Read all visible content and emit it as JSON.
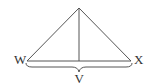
{
  "diagram": {
    "type": "geometry",
    "stroke_color": "#555555",
    "label_color": "#333333",
    "vertices": {
      "apex": {
        "label": "",
        "x": 79,
        "y": 8
      },
      "left": {
        "label": "W",
        "x": 27,
        "y": 61
      },
      "right": {
        "label": "X",
        "x": 131,
        "y": 61
      }
    },
    "altitude": {
      "from": "apex",
      "to_base_x": 79
    },
    "brace": {
      "label": "V",
      "spans": [
        "W",
        "X"
      ]
    },
    "labels": {
      "w": "W",
      "x": "X",
      "v": "V"
    }
  }
}
